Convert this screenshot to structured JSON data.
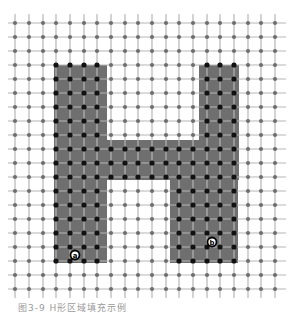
{
  "figure": {
    "caption": "图3-9 H形区域填充示例",
    "colors": {
      "background": "#ffffff",
      "grid_line": "#b5b5b5",
      "grid_node": "#6e6e6e",
      "grid_node_inside": "#111111",
      "region_fill": "#6f6f6f"
    },
    "grid": {
      "x_lines": [
        15,
        29,
        43,
        56,
        70,
        84,
        97,
        111,
        125,
        138,
        152,
        166,
        179,
        193,
        207,
        220,
        234,
        248,
        261,
        275
      ],
      "y_lines": [
        23,
        37,
        51,
        65,
        79,
        93,
        107,
        121,
        135,
        149,
        163,
        177,
        191,
        205,
        219,
        233,
        247,
        261,
        275,
        289
      ],
      "x_extent": [
        8,
        286
      ],
      "y_extent": [
        14,
        298
      ]
    },
    "region": {
      "shape": "H",
      "polygons": [
        {
          "name": "left-stem",
          "x": 54,
          "y": 65,
          "w": 53,
          "h": 198
        },
        {
          "name": "right-stem-upper",
          "x": 199,
          "y": 65,
          "w": 40,
          "h": 115
        },
        {
          "name": "right-stem-lower",
          "x": 170,
          "y": 140,
          "w": 68,
          "h": 123
        },
        {
          "name": "crossbar",
          "x": 107,
          "y": 140,
          "w": 92,
          "h": 40
        }
      ]
    },
    "markers": [
      {
        "label": "a",
        "x": 75,
        "y": 255
      },
      {
        "label": "b",
        "x": 212,
        "y": 242
      }
    ]
  }
}
